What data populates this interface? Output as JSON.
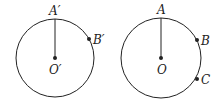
{
  "figures": [
    {
      "name": "left-circle",
      "center": {
        "label": "O′",
        "x": 55,
        "y": 58
      },
      "radius": 39,
      "points": [
        {
          "label": "A′",
          "x": 55,
          "y": 19
        },
        {
          "label": "B′",
          "x": 89,
          "y": 39
        }
      ]
    },
    {
      "name": "right-circle",
      "center": {
        "label": "O",
        "x": 161,
        "y": 58
      },
      "radius": 40,
      "points": [
        {
          "label": "A",
          "x": 161,
          "y": 18
        },
        {
          "label": "B",
          "x": 197,
          "y": 40
        },
        {
          "label": "C",
          "x": 197,
          "y": 79
        }
      ]
    }
  ],
  "colors": {
    "stroke": "#222222",
    "background": "#ffffff"
  }
}
